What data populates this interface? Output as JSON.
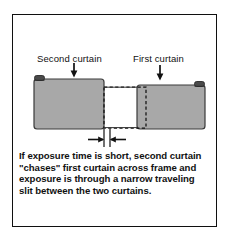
{
  "figure": {
    "labels": {
      "second_curtain": "Second curtain",
      "first_curtain": "First curtain"
    },
    "caption_lines": [
      "If exposure time is short, second curtain",
      "\"chases\" first curtain across frame and",
      "exposure is through a narrow traveling",
      "slit between the two curtains."
    ],
    "colors": {
      "curtain_fill": "#a8a8a8",
      "curtain_stroke": "#3a3a3a",
      "roller_fill": "#4a4a4a",
      "line": "#111111",
      "border": "#101010",
      "background": "#ffffff"
    },
    "icons": {
      "down_arrow_second": "down-arrow-icon",
      "down_arrow_first": "down-arrow-icon",
      "slit_arrow_left": "right-arrow-icon",
      "slit_arrow_right": "left-arrow-icon"
    },
    "annotations": {
      "frame_outline": "dashed-frame-rectangle",
      "slit_gap": "narrow-traveling-slit"
    }
  }
}
